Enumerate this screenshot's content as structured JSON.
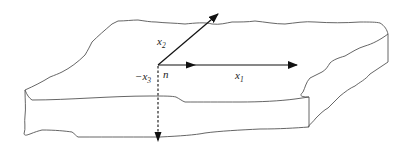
{
  "figure": {
    "labels": {
      "x2": "x",
      "x2_sub": "2",
      "x1": "x",
      "x1_sub": "1",
      "neg_x3": "−x",
      "neg_x3_sub": "3",
      "n": "n"
    },
    "colors": {
      "outline": "#555555",
      "axes": "#111111",
      "background": "#ffffff"
    }
  }
}
